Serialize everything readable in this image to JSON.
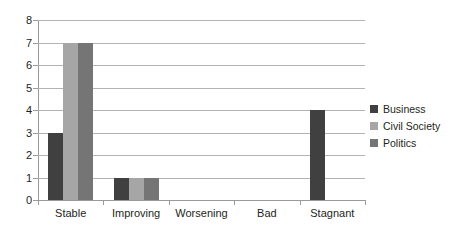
{
  "chart_data": {
    "type": "bar",
    "title": "",
    "xlabel": "",
    "ylabel": "",
    "categories": [
      "Stable",
      "Improving",
      "Worsening",
      "Bad",
      "Stagnant"
    ],
    "series": [
      {
        "name": "Business",
        "color": "#404040",
        "values": [
          3,
          1,
          0,
          0,
          4
        ]
      },
      {
        "name": "Civil Society",
        "color": "#a6a6a6",
        "values": [
          7,
          1,
          0,
          0,
          0
        ]
      },
      {
        "name": "Politics",
        "color": "#757575",
        "values": [
          7,
          1,
          0,
          0,
          0
        ]
      }
    ],
    "ylim": [
      0,
      8
    ],
    "y_ticks": [
      0,
      1,
      2,
      3,
      4,
      5,
      6,
      7,
      8
    ],
    "y_tick_labels": [
      "0",
      "1",
      "2",
      "3",
      "4",
      "5",
      "6",
      "7",
      "8"
    ],
    "grid": true,
    "legend_position": "right",
    "gridline_color": "#b3b3b3",
    "axis_color": "#9a9a9a",
    "text_color": "#231f20",
    "background": "#ffffff"
  }
}
